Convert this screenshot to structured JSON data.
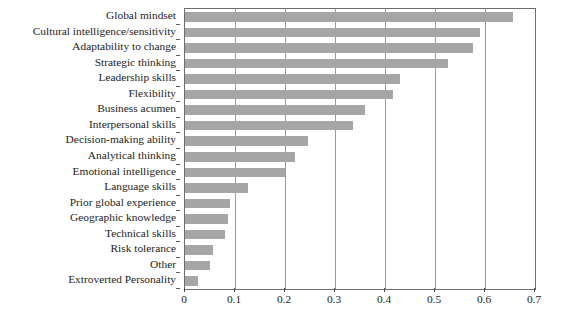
{
  "chart_data": {
    "type": "bar",
    "orientation": "horizontal",
    "title": "",
    "subtitle": "",
    "xlabel": "",
    "ylabel": "",
    "xlim": [
      0,
      0.7
    ],
    "xticks": [
      "0",
      "0.1",
      "0.2",
      "0.3",
      "0.4",
      "0.5",
      "0.6",
      "0.7"
    ],
    "xtick_values": [
      0,
      0.1,
      0.2,
      0.3,
      0.4,
      0.5,
      0.6,
      0.7
    ],
    "grid": "vertical",
    "legend": "none",
    "bar_color": "#a6a6a6",
    "frame_color": "#6e6e6e",
    "categories": [
      "Global mindset",
      "Cultural intelligence/sensitivity",
      "Adaptability to change",
      "Strategic thinking",
      "Leadership skills",
      "Flexibility",
      "Business acumen",
      "Interpersonal skills",
      "Decision-making ability",
      "Analytical thinking",
      "Emotional intelligence",
      "Language skills",
      "Prior global experience",
      "Geographic knowledge",
      "Technical skills",
      "Risk tolerance",
      "Other",
      "Extroverted Personality"
    ],
    "values": [
      0.655,
      0.59,
      0.575,
      0.525,
      0.43,
      0.415,
      0.36,
      0.335,
      0.245,
      0.22,
      0.2,
      0.125,
      0.09,
      0.085,
      0.08,
      0.055,
      0.05,
      0.025
    ]
  }
}
